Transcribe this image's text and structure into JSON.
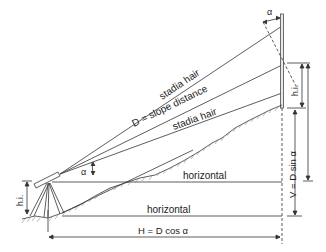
{
  "diagram": {
    "labels": {
      "upper_stadia": "stadia hair",
      "slope_distance": "D = slope distance",
      "lower_stadia": "stadia hair",
      "horizontal_upper": "horizontal",
      "horizontal_lower": "horizontal",
      "horizontal_distance": "H = D cos α",
      "vertical_distance": "V = D sin α",
      "hi_instrument": "h.i.",
      "hi_rod": "h.i.",
      "alpha_instrument": "α",
      "alpha_rod": "α"
    },
    "colors": {
      "line": "#333333",
      "ground_hatch": "#666666",
      "background": "#ffffff"
    }
  }
}
